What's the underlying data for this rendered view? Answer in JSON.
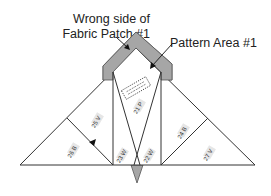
{
  "callouts": {
    "wrong_side_line1": "Wrong side of",
    "wrong_side_line2": "Fabric Patch #1",
    "pattern_area": "Pattern Area #1"
  },
  "pieces": [
    {
      "id": "21",
      "fabric": "P",
      "label": "21 P"
    },
    {
      "id": "22",
      "fabric": "W",
      "label": "22 W"
    },
    {
      "id": "23",
      "fabric": "W",
      "label": "23 W"
    },
    {
      "id": "24",
      "fabric": "B",
      "label": "24 B"
    },
    {
      "id": "25",
      "fabric": "V",
      "label": "25 V"
    },
    {
      "id": "26",
      "fabric": "B",
      "label": "26 B"
    },
    {
      "id": "27",
      "fabric": "V",
      "label": "27 V"
    }
  ],
  "colors": {
    "patch_fill": "#a6a6a6",
    "line": "#333333",
    "label_bg": "#e6e6e6"
  }
}
